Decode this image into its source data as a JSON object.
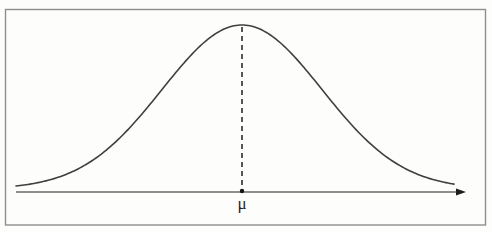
{
  "figure": {
    "mean_label": "μ",
    "colors": {
      "background": "#fdfdfb",
      "frame": "#8e8e8e",
      "curve": "#3f3f3f",
      "axis": "#6a6a6a",
      "arrow": "#1e1e1e",
      "dashed_line": "#3a3a3a",
      "dot": "#141414",
      "label": "#1f1f1f"
    },
    "curve": {
      "type": "normal-distribution",
      "center_x": 242,
      "peak_y": 25,
      "baseline_y": 189,
      "sigma": 80,
      "x_start": 16,
      "x_end": 455
    },
    "axis": {
      "y": 192,
      "x_start": 16,
      "x_end": 458,
      "arrow_tip_x": 466,
      "arrow_length": 10,
      "arrow_half_height": 3.6
    },
    "dashed": {
      "dash": 5,
      "gap": 4
    },
    "frame": {
      "x": 5.5,
      "y": 9.5,
      "width": 480,
      "height": 215.5
    }
  }
}
